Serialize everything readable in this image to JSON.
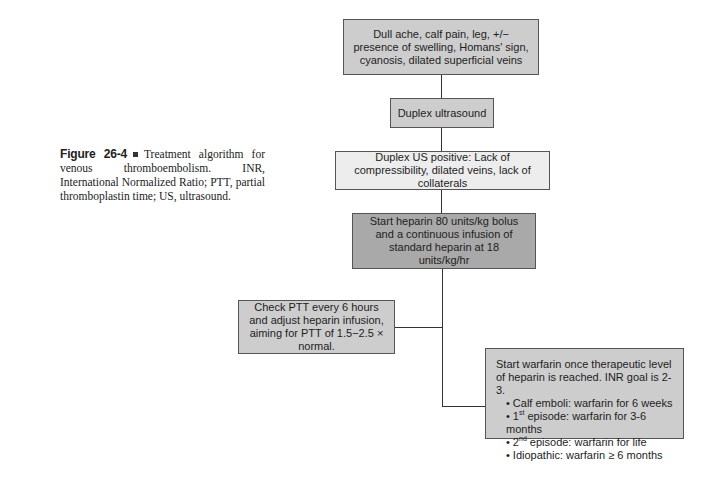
{
  "caption": {
    "figure_label": "Figure 26-4",
    "text": "Treatment algorithm for venous thromboembolism. INR, International Normalized Ratio; PTT, partial thromboplastin time; US, ultrasound."
  },
  "flowchart": {
    "nodes": [
      {
        "id": "symptoms",
        "text": "Dull ache, calf pain, leg, +/− presence of swelling, Homans' sign, cyanosis, dilated superficial veins",
        "fill": "#cdcdcd"
      },
      {
        "id": "duplex",
        "text": "Duplex ultrasound",
        "fill": "#cdcdcd"
      },
      {
        "id": "duplex_positive",
        "text": "Duplex US positive: Lack of compressibility, dilated veins, lack of collaterals",
        "fill": "#ededed"
      },
      {
        "id": "heparin",
        "text": "Start heparin 80 units/kg bolus and a continuous infusion of standard heparin at 18 units/kg/hr",
        "fill": "#a9a9a9"
      },
      {
        "id": "ptt",
        "text": "Check PTT every 6 hours and adjust heparin infusion, aiming for PTT of 1.5−2.5 × normal.",
        "fill": "#cdcdcd"
      },
      {
        "id": "warfarin",
        "intro": "Start warfarin once therapeutic level of heparin is reached. INR goal is 2-3.",
        "fill": "#cdcdcd",
        "bullets": [
          {
            "pre": "Calf emboli: warfarin for 6 weeks",
            "sup": "",
            "post": ""
          },
          {
            "pre": "1",
            "sup": "st",
            "post": " episode: warfarin for 3-6 months"
          },
          {
            "pre": "2",
            "sup": "nd",
            "post": " episode: warfarin for life"
          },
          {
            "pre": "Idiopathic: warfarin ≥ 6 months",
            "sup": "",
            "post": ""
          }
        ]
      }
    ],
    "edges": [
      [
        "symptoms",
        "duplex"
      ],
      [
        "duplex",
        "duplex_positive"
      ],
      [
        "duplex_positive",
        "heparin"
      ],
      [
        "heparin",
        "ptt"
      ],
      [
        "heparin",
        "warfarin"
      ]
    ]
  }
}
